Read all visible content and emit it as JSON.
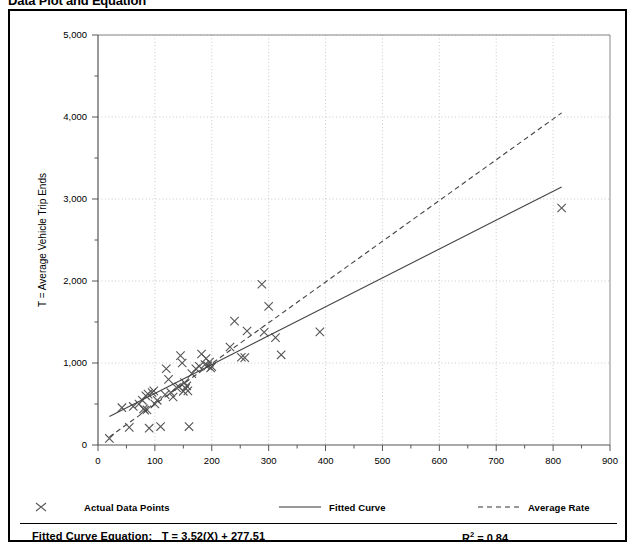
{
  "page": {
    "title": "Data Plot and Equation"
  },
  "legend": {
    "items": [
      {
        "label": "Actual Data Points",
        "symbol": "x-marker"
      },
      {
        "label": "Fitted Curve",
        "symbol": "solid-line"
      },
      {
        "label": "Average Rate",
        "symbol": "dashed-line"
      }
    ]
  },
  "equation": {
    "label": "Fitted Curve Equation:",
    "formula": "T = 3.52(X) + 277.51",
    "r2_label": "R",
    "r2_sup": "2",
    "r2_value": "= 0.84"
  },
  "chart_data": {
    "type": "scatter",
    "title": "Data Plot and Equation",
    "xlabel": "X = Number of Occupied Dwelling Units",
    "ylabel": "T = Average Vehicle Trip Ends",
    "xlim": [
      0,
      900
    ],
    "ylim": [
      0,
      5000
    ],
    "xticks": [
      0,
      100,
      200,
      300,
      400,
      500,
      600,
      700,
      800,
      900
    ],
    "xtick_labels": [
      "0",
      "100",
      "200",
      "300",
      "400",
      "500",
      "600",
      "700",
      "800",
      "900"
    ],
    "yticks": [
      0,
      1000,
      2000,
      3000,
      4000,
      5000
    ],
    "ytick_labels": [
      "0",
      "1,000",
      "2,000",
      "3,000",
      "4,000",
      "5,000"
    ],
    "x_minor_interval": 50,
    "y_minor_interval": 500,
    "grid": true,
    "grid_style": "dotted",
    "grid_color": "#bbbbbb",
    "legend_position": "below-plot",
    "marker": "x",
    "marker_color": "#555555",
    "series": [
      {
        "name": "Actual Data Points",
        "type": "scatter",
        "points": [
          [
            20,
            80
          ],
          [
            42,
            455
          ],
          [
            55,
            215
          ],
          [
            62,
            470
          ],
          [
            72,
            500
          ],
          [
            78,
            545
          ],
          [
            80,
            440
          ],
          [
            82,
            425
          ],
          [
            84,
            600
          ],
          [
            86,
            430
          ],
          [
            88,
            620
          ],
          [
            90,
            205
          ],
          [
            95,
            640
          ],
          [
            98,
            660
          ],
          [
            100,
            500
          ],
          [
            104,
            545
          ],
          [
            110,
            225
          ],
          [
            118,
            615
          ],
          [
            120,
            930
          ],
          [
            124,
            800
          ],
          [
            128,
            640
          ],
          [
            132,
            585
          ],
          [
            138,
            700
          ],
          [
            142,
            710
          ],
          [
            145,
            1090
          ],
          [
            148,
            1000
          ],
          [
            150,
            655
          ],
          [
            152,
            760
          ],
          [
            154,
            690
          ],
          [
            156,
            720
          ],
          [
            158,
            660
          ],
          [
            160,
            225
          ],
          [
            165,
            870
          ],
          [
            172,
            930
          ],
          [
            178,
            960
          ],
          [
            182,
            1110
          ],
          [
            188,
            980
          ],
          [
            190,
            1055
          ],
          [
            193,
            965
          ],
          [
            196,
            1010
          ],
          [
            198,
            940
          ],
          [
            200,
            955
          ],
          [
            232,
            1195
          ],
          [
            240,
            1510
          ],
          [
            252,
            1070
          ],
          [
            258,
            1065
          ],
          [
            262,
            1390
          ],
          [
            288,
            1960
          ],
          [
            292,
            1375
          ],
          [
            300,
            1690
          ],
          [
            312,
            1310
          ],
          [
            322,
            1100
          ],
          [
            390,
            1380
          ],
          [
            815,
            2890
          ]
        ]
      },
      {
        "name": "Fitted Curve",
        "type": "line",
        "style": "solid",
        "slope": 3.52,
        "intercept": 277.51,
        "x_range": [
          20,
          815
        ],
        "endpoints": [
          [
            20,
            348
          ],
          [
            815,
            3147
          ]
        ]
      },
      {
        "name": "Average Rate",
        "type": "line",
        "style": "dashed",
        "slope": 4.97,
        "intercept": 0,
        "x_range": [
          20,
          815
        ],
        "endpoints": [
          [
            20,
            99
          ],
          [
            815,
            4050
          ]
        ]
      }
    ]
  }
}
